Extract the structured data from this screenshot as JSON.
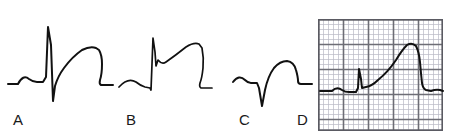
{
  "figure": {
    "background_color": "#ffffff",
    "trace_color": "#111111",
    "grid_fine_color": "#b9b9c4",
    "grid_bold_color": "#6e6e76",
    "width": 453,
    "height": 139
  },
  "panels": [
    {
      "id": "A",
      "label": "A",
      "label_x": 13,
      "label_y": 112,
      "description": "Normal complex: small P wave, tall narrow R wave, deep S wave, rounded upright T wave",
      "baseline_y": 82,
      "features": [
        {
          "name": "p-wave",
          "peak_y": 74
        },
        {
          "name": "r-wave",
          "peak_y": 27
        },
        {
          "name": "s-wave",
          "peak_y": 101
        },
        {
          "name": "t-wave",
          "peak_y": 47
        }
      ],
      "path": "M 8 84 L 18 84 Q 23 74 29 79 Q 33 82 37 82 L 43 82 L 46 77 L 48 27 L 51 45 L 53 101 L 55 86 Q 58 76 64 68 Q 72 57 82 50 Q 90 46 96 48 L 99 50 Q 102 55 102 64 Q 102 74 100 80 Q 99 84 101 85 L 113 85"
    },
    {
      "id": "B",
      "label": "B",
      "label_x": 126,
      "label_y": 112,
      "description": "ST segment elevation: sharp R spike with J point elevation merging into broad elevated ST-T dome",
      "baseline_y": 85,
      "features": [
        {
          "name": "p-wave",
          "peak_y": 78
        },
        {
          "name": "r-wave",
          "peak_y": 38
        },
        {
          "name": "j-point-notch",
          "peak_y": 65
        },
        {
          "name": "st-t-dome",
          "peak_y": 45
        }
      ],
      "path": "M 119 87 Q 128 77 136 82 Q 141 86 145 87 L 150 88 L 151 90 L 153 38 L 155 52 L 156 66 L 158 60 Q 162 65 166 62 Q 176 55 186 47 Q 194 42 199 44 L 202 48 Q 204 58 203 68 Q 202 78 200 83 Q 199 87 201 88 L 212 88"
    },
    {
      "id": "C",
      "label": "C",
      "label_x": 239,
      "label_y": 112,
      "description": "QS complex with no R wave and elevated rounded T wave",
      "baseline_y": 83,
      "features": [
        {
          "name": "p-wave",
          "peak_y": 76
        },
        {
          "name": "q-s-wave",
          "peak_y": 106
        },
        {
          "name": "t-wave",
          "peak_y": 61
        }
      ],
      "path": "M 233 82 Q 239 74 245 80 Q 248 83 251 83 L 257 83 L 259 88 L 262 106 L 265 90 Q 268 76 274 68 Q 280 61 287 61 Q 294 62 296 70 Q 298 77 298 81 Q 298 84 301 84 L 312 84"
    },
    {
      "id": "D",
      "label": "D",
      "label_x": 297,
      "label_y": 112,
      "description": "ECG strip on graph paper showing marked convex ST elevation (tombstone morphology)",
      "grid": {
        "x": 318,
        "y": 19,
        "width": 125,
        "height": 112,
        "fine_spacing": 5,
        "bold_spacing": 25,
        "fine_color": "#b9b9c4",
        "bold_color": "#6e6e76",
        "border_color": "#5a5a62"
      },
      "baseline_y": 91,
      "features": [
        {
          "name": "p-wave",
          "peak_y": 87
        },
        {
          "name": "r-wave",
          "peak_y": 69
        },
        {
          "name": "st-elevation-dome",
          "peak_y": 44
        }
      ],
      "path": "M 320 91 L 332 91 Q 337 86 342 90 Q 345 92 349 92 L 356 92 L 358 88 L 359 69 L 361 79 L 362 88 L 366 87 Q 372 86 378 80 Q 388 72 396 60 Q 402 50 407 45 Q 412 42 416 46 Q 419 52 420 62 Q 421 74 422 83 Q 423 89 426 90 L 431 91 Q 436 89 440 90 L 443 91"
    }
  ]
}
